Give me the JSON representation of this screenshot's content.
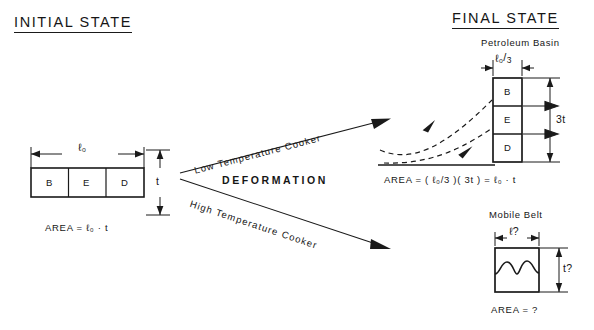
{
  "headings": {
    "initial": "INITIAL STATE",
    "final": "FINAL STATE"
  },
  "initial_state": {
    "cells": [
      "B",
      "E",
      "D"
    ],
    "width_label": "ℓ₀",
    "height_label": "t",
    "area_formula": "AREA  =  ℓ₀ · t"
  },
  "transform": {
    "center_label": "DEFORMATION",
    "upper_arrow_label": "Low Temperature Cooker",
    "lower_arrow_label": "High Temperature Cooker"
  },
  "petroleum_basin": {
    "caption": "Petroleum Basin",
    "cells": [
      "B",
      "E",
      "D"
    ],
    "width_label_numerator": "ℓ₀",
    "width_label_denominator": "3",
    "height_label": "3t",
    "area_formula": "AREA  =  ( ℓ₀/3 )( 3t )  =  ℓ₀ · t"
  },
  "mobile_belt": {
    "caption": "Mobile Belt",
    "width_label": "ℓ?",
    "height_label": "t?",
    "area_formula": "AREA  =  ?"
  },
  "colors": {
    "ink": "#161616",
    "line": "#1a1a1a",
    "paper": "#ffffff"
  }
}
